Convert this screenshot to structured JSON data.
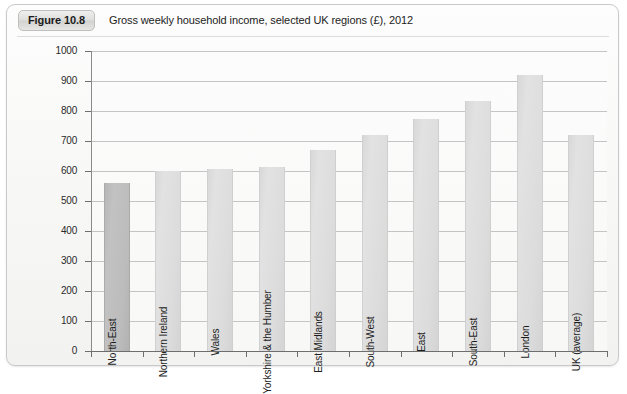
{
  "figure": {
    "badge": "Figure 10.8",
    "caption": "Gross weekly household income, selected UK regions (£), 2012"
  },
  "chart_data": {
    "type": "bar",
    "title": "Gross weekly household income, selected UK regions (£), 2012",
    "xlabel": "",
    "ylabel": "",
    "ylim": [
      0,
      1000
    ],
    "ytick_step": 100,
    "yticks": [
      "1000",
      "900",
      "800",
      "700",
      "600",
      "500",
      "400",
      "300",
      "200",
      "100",
      "0"
    ],
    "grid": true,
    "legend": "none",
    "categories": [
      "North-East",
      "Northern Ireland",
      "Wales",
      "Yorkshire & the Humber",
      "East Midlands",
      "South-West",
      "East",
      "South-East",
      "London",
      "UK (average)"
    ],
    "values": [
      560,
      600,
      607,
      612,
      670,
      720,
      775,
      835,
      920,
      720
    ],
    "highlighted": [
      "North-East"
    ],
    "colors": {
      "bar": "#dcdcdc",
      "bar_highlight": "#bcbcbc",
      "gridline": "#c4c4c4",
      "axis": "#6e6e6e",
      "text": "#1d1d1d",
      "frame": "#c9c9c9"
    }
  }
}
